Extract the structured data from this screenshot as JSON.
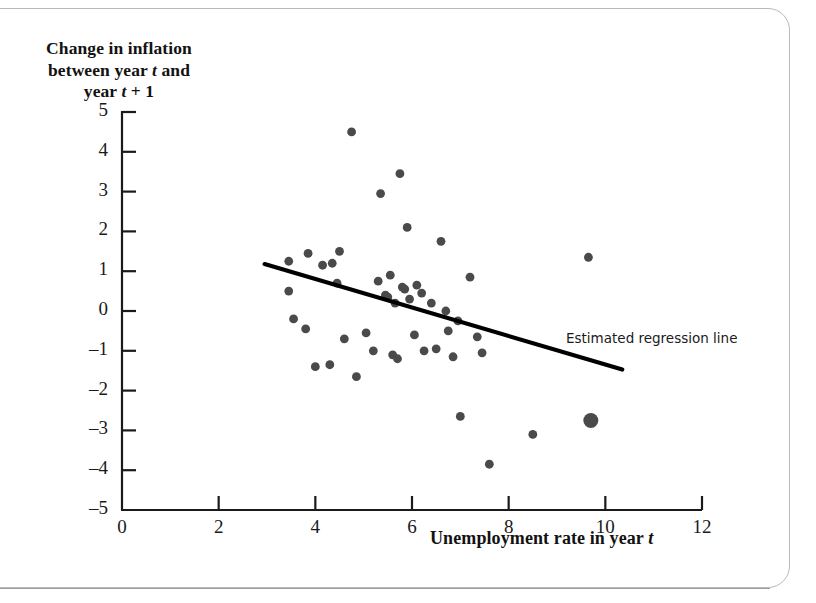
{
  "figure": {
    "y_axis_title_lines": [
      "Change in inflation",
      "between year t and",
      "year t + 1"
    ],
    "x_axis_title": "Unemployment rate in year t",
    "annotation": "Estimated regression line"
  },
  "chart_data": {
    "type": "scatter",
    "title": "",
    "xlabel": "Unemployment rate in year t",
    "ylabel": "Change in inflation between year t and year t + 1",
    "xlim": [
      0,
      12
    ],
    "ylim": [
      -5,
      5
    ],
    "xticks": [
      0,
      2,
      4,
      6,
      8,
      10,
      12
    ],
    "yticks": [
      5,
      4,
      3,
      2,
      1,
      0,
      -1,
      -2,
      -3,
      -4,
      -5
    ],
    "grid": false,
    "legend": "none",
    "marker_color": "#4a4a4a",
    "line_color": "#000000",
    "points": [
      {
        "x": 3.45,
        "y": 1.25
      },
      {
        "x": 3.45,
        "y": 0.5
      },
      {
        "x": 3.55,
        "y": -0.2
      },
      {
        "x": 3.8,
        "y": -0.45
      },
      {
        "x": 3.85,
        "y": 1.45
      },
      {
        "x": 4.0,
        "y": -1.4
      },
      {
        "x": 4.15,
        "y": 1.15
      },
      {
        "x": 4.3,
        "y": -1.35
      },
      {
        "x": 4.35,
        "y": 1.2
      },
      {
        "x": 4.45,
        "y": 0.7
      },
      {
        "x": 4.5,
        "y": 1.5
      },
      {
        "x": 4.6,
        "y": -0.7
      },
      {
        "x": 4.75,
        "y": 4.5
      },
      {
        "x": 4.85,
        "y": -1.65
      },
      {
        "x": 5.05,
        "y": -0.55
      },
      {
        "x": 5.2,
        "y": -1.0
      },
      {
        "x": 5.3,
        "y": 0.75
      },
      {
        "x": 5.35,
        "y": 2.95
      },
      {
        "x": 5.45,
        "y": 0.4
      },
      {
        "x": 5.5,
        "y": 0.35
      },
      {
        "x": 5.55,
        "y": 0.9
      },
      {
        "x": 5.6,
        "y": -1.1
      },
      {
        "x": 5.65,
        "y": 0.2
      },
      {
        "x": 5.7,
        "y": -1.2
      },
      {
        "x": 5.75,
        "y": 3.45
      },
      {
        "x": 5.8,
        "y": 0.6
      },
      {
        "x": 5.85,
        "y": 0.55
      },
      {
        "x": 5.9,
        "y": 2.1
      },
      {
        "x": 5.95,
        "y": 0.3
      },
      {
        "x": 6.05,
        "y": -0.6
      },
      {
        "x": 6.1,
        "y": 0.65
      },
      {
        "x": 6.2,
        "y": 0.45
      },
      {
        "x": 6.25,
        "y": -1.0
      },
      {
        "x": 6.4,
        "y": 0.2
      },
      {
        "x": 6.5,
        "y": -0.95
      },
      {
        "x": 6.6,
        "y": 1.75
      },
      {
        "x": 6.7,
        "y": 0.0
      },
      {
        "x": 6.75,
        "y": -0.5
      },
      {
        "x": 6.85,
        "y": -1.15
      },
      {
        "x": 6.95,
        "y": -0.25
      },
      {
        "x": 7.0,
        "y": -2.65
      },
      {
        "x": 7.2,
        "y": 0.85
      },
      {
        "x": 7.35,
        "y": -0.65
      },
      {
        "x": 7.45,
        "y": -1.05
      },
      {
        "x": 7.6,
        "y": -3.85
      },
      {
        "x": 8.5,
        "y": -3.1
      },
      {
        "x": 9.65,
        "y": 1.35
      },
      {
        "x": 9.7,
        "y": -2.75,
        "size": "large"
      }
    ],
    "regression_line": {
      "label": "Estimated regression line",
      "x_start": 2.95,
      "y_start": 1.18,
      "x_end": 10.35,
      "y_end": -1.47
    }
  }
}
